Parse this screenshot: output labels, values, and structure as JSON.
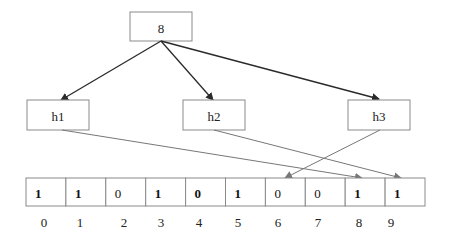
{
  "diagram": {
    "root": {
      "id": "root",
      "label": "8"
    },
    "hash_functions": [
      {
        "id": "h1",
        "label": "h1",
        "target_index": 8
      },
      {
        "id": "h2",
        "label": "h2",
        "target_index": 9
      },
      {
        "id": "h3",
        "label": "h3",
        "target_index": 6
      }
    ],
    "bit_array": {
      "bits": [
        "1",
        "1",
        "0",
        "1",
        "0",
        "1",
        "0",
        "0",
        "1",
        "1"
      ],
      "bold": [
        true,
        true,
        false,
        true,
        true,
        true,
        false,
        false,
        true,
        true
      ],
      "indices": [
        "0",
        "1",
        "2",
        "3",
        "4",
        "5",
        "6",
        "7",
        "8",
        "9"
      ]
    },
    "colors": {
      "box_border": "#8a8a8a",
      "root_edges": "#2a2a2a",
      "hash_edges": "#777777",
      "text": "#222222"
    }
  }
}
